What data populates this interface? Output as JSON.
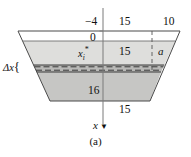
{
  "figure": {
    "caption": "(a)",
    "type": "geometry-diagram",
    "colors": {
      "band_top_fill": "#ffffff",
      "band_mid_fill": "#dcdcdc",
      "band_bottom_fill": "#c4c4c4",
      "strip_fill": "#b8b8b8",
      "outline": "#3c3c3c",
      "dashed": "#2e2e2e",
      "axis": "#6b6b6b",
      "text": "#111111"
    },
    "labels": {
      "neg_four": "−4",
      "zero": "0",
      "fifteen_top": "15",
      "ten": "10",
      "fifteen_mid": "15",
      "a": "a",
      "sixteen": "16",
      "fifteen_bottom": "15",
      "delta_x": "Δx",
      "delta_x_brace": "{",
      "x_sample_base": "x",
      "x_sample_sub": "i",
      "x_sample_sup": "*",
      "x_axis": "x",
      "x_axis_arrow": "▼"
    },
    "geometry": {
      "top_left": [
        18,
        31
      ],
      "top_right": [
        180,
        31
      ],
      "bottom_left": [
        50,
        101
      ],
      "bottom_right": [
        150,
        101
      ],
      "zero_line_y": 41,
      "strip_top_y": 65,
      "strip_bottom_y": 72,
      "axis_x": 103,
      "axis_top_y": 8,
      "axis_bottom_y": 126,
      "dashed_vertical_x": 152
    },
    "dimensions": {
      "top_width_label": "15",
      "overhang_label": "10",
      "depth_to_zero": "−4",
      "mid_width": "15",
      "lower_height": "16",
      "bottom_width": "15",
      "strip_thickness": "Δx",
      "half_width_at_sample": "a"
    }
  }
}
